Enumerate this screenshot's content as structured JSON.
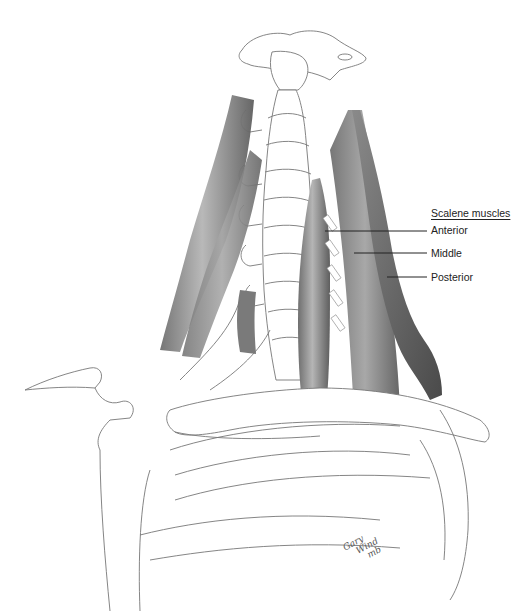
{
  "figure": {
    "labels": {
      "group_title": "Scalene muscles",
      "items": [
        {
          "name": "Anterior",
          "label_x": 431,
          "label_y": 224,
          "line": {
            "x1": 325,
            "y1": 231,
            "x2": 427,
            "y2": 231
          }
        },
        {
          "name": "Middle",
          "label_x": 431,
          "label_y": 247,
          "line": {
            "x1": 354,
            "y1": 253,
            "x2": 427,
            "y2": 253
          }
        },
        {
          "name": "Posterior",
          "label_x": 431,
          "label_y": 271,
          "line": {
            "x1": 387,
            "y1": 277,
            "x2": 427,
            "y2": 277
          }
        }
      ]
    },
    "signature": {
      "line1": "Gary",
      "line2": "Wind",
      "line3": "mb"
    },
    "colors": {
      "background": "#ffffff",
      "bone_line": "#6a6a6a",
      "muscle_dark": "#5a5a5a",
      "muscle_mid": "#8a8a8a",
      "muscle_light": "#c4c4c4",
      "label_text": "#222222",
      "leader_line": "#222222"
    }
  }
}
